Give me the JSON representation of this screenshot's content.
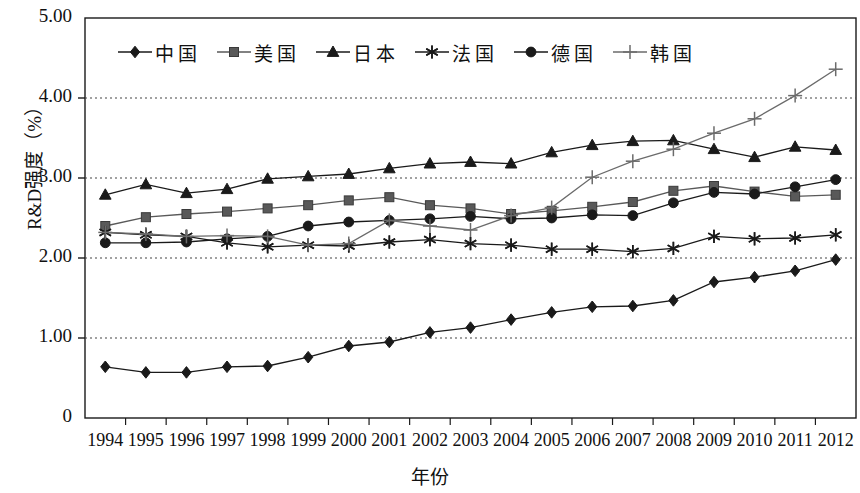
{
  "chart_data": {
    "type": "line",
    "title": "",
    "xlabel": "年份",
    "ylabel": "R&D强度（%）",
    "xlim": [
      1993.5,
      2012.5
    ],
    "ylim": [
      0,
      5
    ],
    "grid": "horizontal-dotted",
    "legend_position": "top-inside",
    "categories": [
      "1994",
      "1995",
      "1996",
      "1997",
      "1998",
      "1999",
      "2000",
      "2001",
      "2002",
      "2003",
      "2004",
      "2005",
      "2006",
      "2007",
      "2008",
      "2009",
      "2010",
      "2011",
      "2012"
    ],
    "ytick_labels": [
      "0",
      "1.00",
      "2.00",
      "3.00",
      "4.00",
      "5.00"
    ],
    "ytick_values": [
      0,
      1,
      2,
      3,
      4,
      5
    ],
    "series": [
      {
        "name": "中国",
        "marker": "diamond",
        "color": "#1a1a1a",
        "values": [
          0.64,
          0.57,
          0.57,
          0.64,
          0.65,
          0.76,
          0.9,
          0.95,
          1.07,
          1.13,
          1.23,
          1.32,
          1.39,
          1.4,
          1.47,
          1.7,
          1.76,
          1.84,
          1.98
        ]
      },
      {
        "name": "美国",
        "marker": "square",
        "color": "#595959",
        "values": [
          2.4,
          2.51,
          2.55,
          2.58,
          2.62,
          2.66,
          2.72,
          2.76,
          2.66,
          2.62,
          2.55,
          2.59,
          2.64,
          2.7,
          2.84,
          2.9,
          2.83,
          2.77,
          2.79
        ]
      },
      {
        "name": "日本",
        "marker": "triangle",
        "color": "#1a1a1a",
        "values": [
          2.79,
          2.92,
          2.81,
          2.86,
          2.99,
          3.02,
          3.05,
          3.12,
          3.18,
          3.2,
          3.18,
          3.32,
          3.41,
          3.46,
          3.47,
          3.36,
          3.26,
          3.39,
          3.35
        ]
      },
      {
        "name": "法国",
        "marker": "asterisk",
        "color": "#1a1a1a",
        "values": [
          2.32,
          2.29,
          2.27,
          2.19,
          2.14,
          2.16,
          2.15,
          2.2,
          2.23,
          2.18,
          2.16,
          2.11,
          2.11,
          2.08,
          2.12,
          2.27,
          2.24,
          2.25,
          2.29
        ]
      },
      {
        "name": "德国",
        "marker": "circle",
        "color": "#1a1a1a",
        "values": [
          2.19,
          2.19,
          2.2,
          2.24,
          2.27,
          2.4,
          2.45,
          2.47,
          2.49,
          2.52,
          2.49,
          2.5,
          2.54,
          2.53,
          2.69,
          2.82,
          2.8,
          2.89,
          2.98
        ]
      },
      {
        "name": "韩国",
        "marker": "plus",
        "color": "#6b6b6b",
        "values": [
          2.32,
          2.3,
          2.27,
          2.28,
          2.27,
          2.16,
          2.18,
          2.47,
          2.4,
          2.35,
          2.53,
          2.63,
          3.01,
          3.21,
          3.36,
          3.56,
          3.74,
          4.03,
          4.36
        ]
      }
    ]
  }
}
